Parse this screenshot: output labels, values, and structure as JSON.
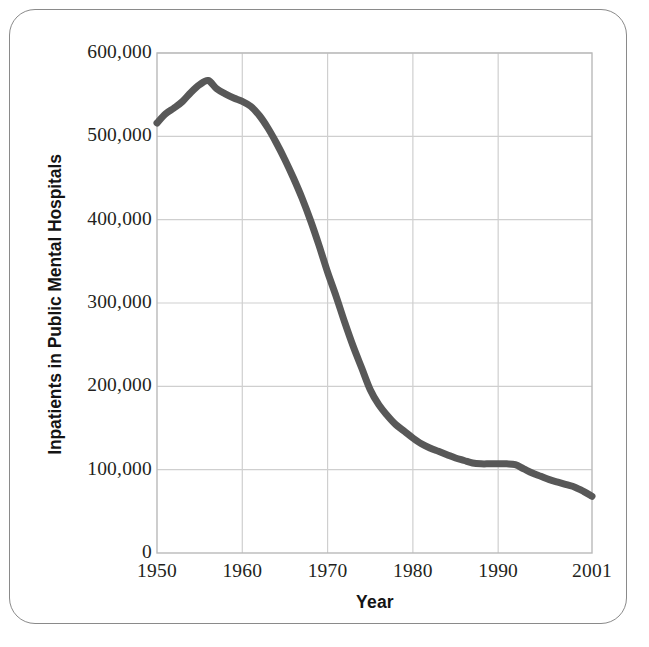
{
  "chart_data": {
    "type": "line",
    "title": "",
    "xlabel": "Year",
    "ylabel": "Inpatients in Public Mental Hospitals",
    "xlim": [
      1950,
      2001
    ],
    "ylim": [
      0,
      600000
    ],
    "grid": true,
    "legend": "none",
    "line_color": "#585858",
    "grid_color": "#cfcfcf",
    "axis_color": "#b4b4b4",
    "x_tick_labels": [
      "1950",
      "1960",
      "1970",
      "1980",
      "1990",
      "2001"
    ],
    "x_tick_values": [
      1950,
      1960,
      1970,
      1980,
      1990,
      2001
    ],
    "y_tick_labels": [
      "0",
      "100,000",
      "200,000",
      "300,000",
      "400,000",
      "500,000",
      "600,000"
    ],
    "y_tick_values": [
      0,
      100000,
      200000,
      300000,
      400000,
      500000,
      600000
    ],
    "series": [
      {
        "name": "Inpatients in Public Mental Hospitals",
        "x": [
          1950,
          1951,
          1952,
          1953,
          1954,
          1955,
          1956,
          1957,
          1958,
          1959,
          1960,
          1961,
          1962,
          1963,
          1964,
          1965,
          1966,
          1967,
          1968,
          1969,
          1970,
          1971,
          1972,
          1973,
          1974,
          1975,
          1976,
          1977,
          1978,
          1979,
          1980,
          1981,
          1982,
          1983,
          1984,
          1985,
          1986,
          1987,
          1988,
          1989,
          1990,
          1991,
          1992,
          1993,
          1994,
          1995,
          1996,
          1997,
          1998,
          1999,
          2000,
          2001
        ],
        "values": [
          516000,
          527000,
          534000,
          542000,
          553000,
          562000,
          567000,
          557000,
          551000,
          546000,
          542000,
          536000,
          525000,
          510000,
          492000,
          472000,
          450000,
          426000,
          399000,
          369000,
          337000,
          308000,
          277000,
          248000,
          222000,
          196000,
          178000,
          165000,
          154000,
          146000,
          138000,
          131000,
          126000,
          122000,
          118000,
          114000,
          111000,
          108000,
          107000,
          107000,
          107000,
          107000,
          106000,
          101000,
          96000,
          92000,
          88000,
          85000,
          82000,
          79000,
          74000,
          68000
        ]
      }
    ]
  },
  "axis_titles": {
    "x": "Year",
    "y": "Inpatients in Public Mental Hospitals"
  }
}
